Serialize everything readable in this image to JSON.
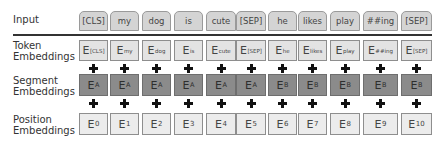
{
  "labels": {
    "input": "Input",
    "token": [
      "Token",
      "Embeddings"
    ],
    "segment": [
      "Segment",
      "Embeddings"
    ],
    "position": [
      "Position",
      "Embeddings"
    ]
  },
  "tokens": [
    "[CLS]",
    "my",
    "dog",
    "is",
    "cute",
    "[SEP]",
    "he",
    "likes",
    "play",
    "##ing",
    "[SEP]"
  ],
  "token_embeddings": [
    {
      "base": "E",
      "sub": "[CLS]"
    },
    {
      "base": "E",
      "sub": "my"
    },
    {
      "base": "E",
      "sub": "dog"
    },
    {
      "base": "E",
      "sub": "is"
    },
    {
      "base": "E",
      "sub": "cute"
    },
    {
      "base": "E",
      "sub": "[SEP]"
    },
    {
      "base": "E",
      "sub": "he"
    },
    {
      "base": "E",
      "sub": "likes"
    },
    {
      "base": "E",
      "sub": "play"
    },
    {
      "base": "E",
      "sub": "##ing"
    },
    {
      "base": "E",
      "sub": "[SEP]"
    }
  ],
  "segment_embeddings": [
    {
      "base": "E",
      "sub": "A"
    },
    {
      "base": "E",
      "sub": "A"
    },
    {
      "base": "E",
      "sub": "A"
    },
    {
      "base": "E",
      "sub": "A"
    },
    {
      "base": "E",
      "sub": "A"
    },
    {
      "base": "E",
      "sub": "A"
    },
    {
      "base": "E",
      "sub": "B"
    },
    {
      "base": "E",
      "sub": "B"
    },
    {
      "base": "E",
      "sub": "B"
    },
    {
      "base": "E",
      "sub": "B"
    },
    {
      "base": "E",
      "sub": "B"
    }
  ],
  "position_embeddings": [
    {
      "base": "E",
      "sub": "0"
    },
    {
      "base": "E",
      "sub": "1"
    },
    {
      "base": "E",
      "sub": "2"
    },
    {
      "base": "E",
      "sub": "3"
    },
    {
      "base": "E",
      "sub": "4"
    },
    {
      "base": "E",
      "sub": "5"
    },
    {
      "base": "E",
      "sub": "6"
    },
    {
      "base": "E",
      "sub": "7"
    },
    {
      "base": "E",
      "sub": "8"
    },
    {
      "base": "E",
      "sub": "9"
    },
    {
      "base": "E",
      "sub": "10"
    }
  ],
  "colors": {
    "input_tab": "#d4d4d4",
    "token_box": "#e3e3e3",
    "segment_box": "#8b8b8b",
    "position_box": "#ececec"
  }
}
